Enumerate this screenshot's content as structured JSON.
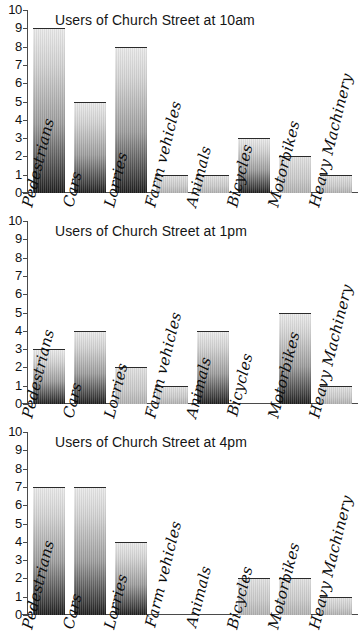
{
  "chart_data": [
    {
      "type": "bar",
      "title": "Users of Church Street at 10am",
      "categories": [
        "Pedestrians",
        "Cars",
        "Lorries",
        "Farm vehicles",
        "Animals",
        "Bicycles",
        "Motorbikes",
        "Heavy Machinery"
      ],
      "values": [
        9,
        5,
        8,
        1,
        1,
        3,
        2,
        1
      ],
      "xlabel": "",
      "ylabel": "",
      "ylim": [
        0,
        10
      ],
      "yticks": [
        0,
        1,
        2,
        3,
        4,
        5,
        6,
        7,
        8,
        9,
        10
      ],
      "grid": false,
      "legend": "none"
    },
    {
      "type": "bar",
      "title": "Users of Church Street at 1pm",
      "categories": [
        "Pedestrians",
        "Cars",
        "Lorries",
        "Farm vehicles",
        "Animals",
        "Bicycles",
        "Motorbikes",
        "Heavy Machinery"
      ],
      "values": [
        3,
        4,
        2,
        1,
        4,
        0,
        5,
        1
      ],
      "xlabel": "",
      "ylabel": "",
      "ylim": [
        0,
        10
      ],
      "yticks": [
        0,
        1,
        2,
        3,
        4,
        5,
        6,
        7,
        8,
        9,
        10
      ],
      "grid": false,
      "legend": "none"
    },
    {
      "type": "bar",
      "title": "Users of Church Street at 4pm",
      "categories": [
        "Pedestrians",
        "Cars",
        "Lorries",
        "Farm vehicles",
        "Animals",
        "Bicycles",
        "Motorbikes",
        "Heavy Machinery"
      ],
      "values": [
        7,
        7,
        4,
        0,
        0,
        2,
        2,
        1
      ],
      "xlabel": "",
      "ylabel": "",
      "ylim": [
        0,
        10
      ],
      "yticks": [
        0,
        1,
        2,
        3,
        4,
        5,
        6,
        7,
        8,
        9,
        10
      ],
      "grid": false,
      "legend": "none"
    }
  ]
}
